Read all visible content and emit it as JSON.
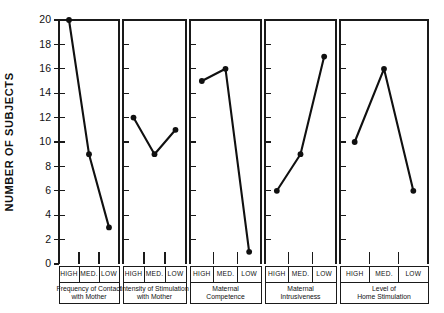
{
  "chart_data": {
    "type": "line",
    "title": "",
    "subtitle": "",
    "xlabel": "",
    "ylabel": "NUMBER OF SUBJECTS",
    "ylim": [
      0,
      20
    ],
    "ytick_labels": [
      "0",
      "2",
      "4",
      "6",
      "8",
      "10",
      "12",
      "14",
      "16",
      "18",
      "20"
    ],
    "ytick_values": [
      0,
      2,
      4,
      6,
      8,
      10,
      12,
      14,
      16,
      18,
      20
    ],
    "grid": false,
    "legend": "none",
    "categories": [
      "HIGH",
      "MED.",
      "LOW"
    ],
    "panels": [
      {
        "name": "frequency-of-contact-with-mother",
        "title_line1": "Frequency of Contact",
        "title_line2": "with Mother",
        "categories": [
          "HIGH",
          "MED.",
          "LOW"
        ],
        "values": [
          20,
          9,
          3
        ]
      },
      {
        "name": "intensity-of-stimulation-with-mother",
        "title_line1": "Intensity of Stimulation",
        "title_line2": "with Mother",
        "categories": [
          "HIGH",
          "MED.",
          "LOW"
        ],
        "values": [
          12,
          9,
          11
        ]
      },
      {
        "name": "maternal-competence",
        "title_line1": "Maternal",
        "title_line2": "Competence",
        "categories": [
          "HIGH",
          "MED.",
          "LOW"
        ],
        "values": [
          15,
          16,
          1
        ]
      },
      {
        "name": "maternal-intrusiveness",
        "title_line1": "Maternal",
        "title_line2": "Intrusiveness",
        "categories": [
          "HIGH",
          "MED.",
          "LOW"
        ],
        "values": [
          6,
          9,
          17
        ]
      },
      {
        "name": "level-of-home-stimulation",
        "title_line1": "Level of",
        "title_line2": "Home Stimulation",
        "categories": [
          "HIGH",
          "MED.",
          "LOW"
        ],
        "values": [
          10,
          16,
          6
        ]
      }
    ],
    "colors": {
      "line": "#101010",
      "marker": "#101010",
      "axis": "#1a1a1a",
      "text": "#111111",
      "background": "#ffffff"
    }
  }
}
